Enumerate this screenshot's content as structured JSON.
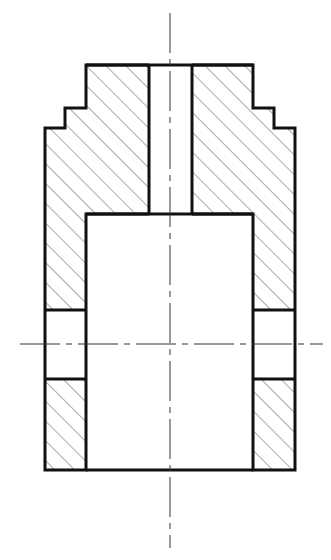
{
  "drawing": {
    "type": "sectional-view",
    "width": 331,
    "height": 560,
    "colors": {
      "outline": "#111111",
      "hatch": "#555555",
      "centerline": "#333333",
      "background": "#ffffff"
    },
    "part": {
      "top_y": 65,
      "bottom_y": 470,
      "steps_left": [
        {
          "x": 86,
          "y": 65
        },
        {
          "x": 86,
          "y": 108
        },
        {
          "x": 65,
          "y": 108
        },
        {
          "x": 65,
          "y": 128
        },
        {
          "x": 45,
          "y": 128
        }
      ],
      "steps_right": [
        {
          "x": 253,
          "y": 65
        },
        {
          "x": 253,
          "y": 108
        },
        {
          "x": 274,
          "y": 108
        },
        {
          "x": 274,
          "y": 128
        },
        {
          "x": 295,
          "y": 128
        }
      ],
      "outer_left_x": 45,
      "outer_right_x": 295,
      "bore": {
        "left_x": 149,
        "right_x": 192,
        "top_y": 65,
        "bottom_y": 214
      },
      "cavity": {
        "left_x": 86,
        "right_x": 253,
        "top_y": 214,
        "bottom_y": 470
      },
      "side_holes": {
        "top_y": 310,
        "bottom_y": 379
      }
    },
    "centerlines": {
      "vertical": {
        "x": 170,
        "y1": 13,
        "y2": 548
      },
      "horizontal": {
        "y": 344,
        "x1": 20,
        "x2": 323
      }
    }
  }
}
